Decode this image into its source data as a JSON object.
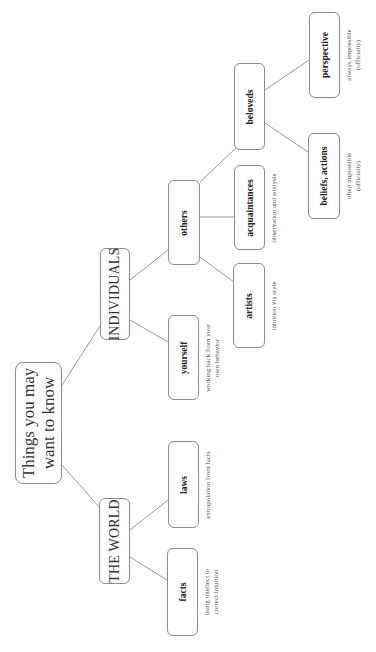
{
  "root": {
    "label": "Things you may\nwant to know"
  },
  "categories": {
    "world": {
      "label": "THE WORLD"
    },
    "individuals": {
      "label": "INDIVIDUALS"
    }
  },
  "nodes": {
    "facts": {
      "label": "facts",
      "note": "using intellect to\ncorrect intuition"
    },
    "laws": {
      "label": "laws",
      "note": "extrapolation from facts"
    },
    "yourself": {
      "label": "yourself",
      "note": "working back from your\nown behavior"
    },
    "others": {
      "label": "others"
    },
    "artists": {
      "label": "artists",
      "note": "intuition via style"
    },
    "acquaintances": {
      "label": "acquaintances",
      "note": "observation and analysis"
    },
    "beloveds": {
      "label": "beloveds"
    },
    "beliefs_actions": {
      "label": "beliefs, actions",
      "note": "often impossible\n(officially)"
    },
    "perspective": {
      "label": "perspective",
      "note": "always impossible\n(officially)"
    }
  },
  "style": {
    "line_color": "#9a9a9a",
    "border_color": "#8a8a8a"
  }
}
